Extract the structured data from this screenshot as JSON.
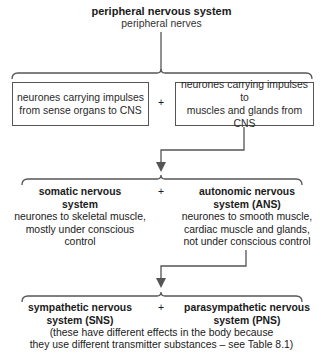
{
  "root": {
    "title": "peripheral nervous system",
    "subtitle": "peripheral nerves"
  },
  "level1": {
    "left_box": [
      "neurones carrying impulses",
      "from sense organs to CNS"
    ],
    "plus": "+",
    "right_box": [
      "neurones carrying impulses to",
      "muscles and glands from CNS"
    ]
  },
  "level2": {
    "left": {
      "title": [
        "somatic nervous",
        "system"
      ],
      "desc": [
        "neurones to skeletal muscle,",
        "mostly under conscious",
        "control"
      ]
    },
    "plus": "+",
    "right": {
      "title": [
        "autonomic nervous",
        "system (ANS)"
      ],
      "desc": [
        "neurones to smooth muscle,",
        "cardiac muscle and glands,",
        "not under conscious control"
      ]
    }
  },
  "level3": {
    "left": {
      "title": [
        "sympathetic nervous",
        "system (SNS)"
      ]
    },
    "plus": "+",
    "right": {
      "title": [
        "parasympathetic nervous",
        "system (PNS)"
      ]
    },
    "note": [
      "(these have different effects in the body because",
      "they use different transmitter substances – see Table 8.1)"
    ]
  },
  "colors": {
    "line": "#555555",
    "text": "#1a1a1a"
  }
}
